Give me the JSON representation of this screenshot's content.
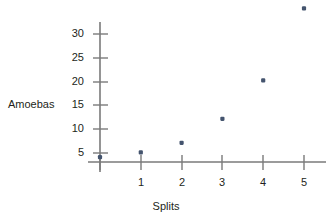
{
  "chart_data": {
    "type": "scatter",
    "title": "",
    "xlabel": "Splits",
    "ylabel": "Amoebas",
    "x": [
      0,
      1,
      2,
      3,
      4,
      5
    ],
    "values": [
      1,
      2,
      4,
      9,
      17,
      32
    ],
    "points": [
      {
        "x": 0,
        "y": 1
      },
      {
        "x": 1,
        "y": 2
      },
      {
        "x": 2,
        "y": 4
      },
      {
        "x": 3,
        "y": 9
      },
      {
        "x": 4,
        "y": 17
      },
      {
        "x": 5,
        "y": 32
      }
    ],
    "xlim": [
      0,
      5.6
    ],
    "ylim": [
      0,
      35
    ],
    "x_tick_labels": [
      "1",
      "2",
      "3",
      "4",
      "5"
    ],
    "x_tick_values": [
      1,
      2,
      3,
      4,
      5
    ],
    "y_tick_labels": [
      "5",
      "10",
      "15",
      "20",
      "25",
      "30"
    ],
    "y_tick_values": [
      5,
      10,
      15,
      20,
      25,
      30
    ],
    "grid": false,
    "legend": false,
    "legend_position": "none",
    "marker_color": "#44546e",
    "axis_color": "#7a7a7a",
    "text_color": "#231f20"
  }
}
